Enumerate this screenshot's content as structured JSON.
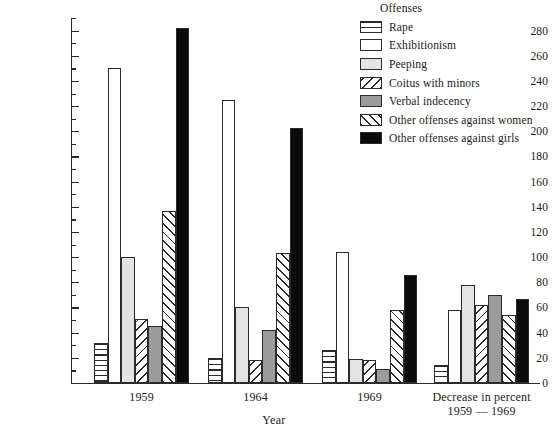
{
  "chart_data": {
    "type": "bar",
    "title": "",
    "xlabel": "Year",
    "ylabel": "",
    "ylim": [
      0,
      290
    ],
    "ytick_step": 20,
    "yminor_step": 10,
    "grid": false,
    "legend_position": "top-right",
    "legend_title": "Offenses",
    "categories": [
      "1959",
      "1964",
      "1969",
      "Decrease in percent 1959 — 1969"
    ],
    "category_labels": [
      {
        "line1": "1959",
        "line2": ""
      },
      {
        "line1": "1964",
        "line2": ""
      },
      {
        "line1": "1969",
        "line2": ""
      },
      {
        "line1": "Decrease in percent",
        "line2": "1959 — 1969"
      }
    ],
    "ytick_labels": [
      "0",
      "20",
      "40",
      "60",
      "80",
      "100",
      "120",
      "140",
      "160",
      "180",
      "200",
      "220",
      "240",
      "260",
      "280"
    ],
    "series": [
      {
        "name": "Rape",
        "pattern": "horizontal-lines",
        "color": "#ffffff",
        "values": [
          32,
          20,
          26,
          14
        ]
      },
      {
        "name": "Exhibitionism",
        "pattern": "solid-white",
        "color": "#ffffff",
        "values": [
          250,
          225,
          104,
          58
        ]
      },
      {
        "name": "Peeping",
        "pattern": "solid-light-gray",
        "color": "#e3e3e1",
        "values": [
          100,
          60,
          19,
          78
        ]
      },
      {
        "name": "Coitus with minors",
        "pattern": "backslash-hatch",
        "color": "#ffffff",
        "values": [
          51,
          18,
          18,
          62
        ]
      },
      {
        "name": "Verbal indecency",
        "pattern": "solid-gray",
        "color": "#9b9b99",
        "values": [
          45,
          42,
          11,
          70
        ]
      },
      {
        "name": "Other offenses against women",
        "pattern": "slash-hatch",
        "color": "#ffffff",
        "values": [
          137,
          103,
          58,
          54
        ]
      },
      {
        "name": "Other offenses against girls",
        "pattern": "solid-black",
        "color": "#0b0b0b",
        "values": [
          282,
          203,
          86,
          67
        ]
      }
    ]
  },
  "legend": {
    "title": "Offenses",
    "items": [
      {
        "label": "Rape",
        "swatch": "horizontal-lines-swatch"
      },
      {
        "label": "Exhibitionism",
        "swatch": "solid-white-swatch"
      },
      {
        "label": "Peeping",
        "swatch": "solid-light-gray-swatch"
      },
      {
        "label": "Coitus with minors",
        "swatch": "backslash-hatch-swatch"
      },
      {
        "label": "Verbal indecency",
        "swatch": "solid-gray-swatch"
      },
      {
        "label": "Other offenses against women",
        "swatch": "slash-hatch-swatch"
      },
      {
        "label": "Other offenses against girls",
        "swatch": "solid-black-swatch"
      }
    ]
  },
  "axis": {
    "x_title": "Year"
  }
}
